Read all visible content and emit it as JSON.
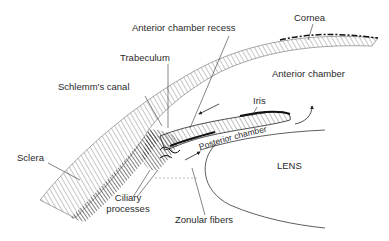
{
  "diagram": {
    "labels": {
      "cornea": "Cornea",
      "anterior_chamber_recess": "Anterior chamber recess",
      "trabeculum": "Trabeculum",
      "schlemms_canal": "Schlemm's canal",
      "anterior_chamber": "Anterior chamber",
      "iris": "Iris",
      "posterior_chamber": "Posterior chamber",
      "lens": "LENS",
      "sclera": "Sclera",
      "ciliary_processes_line1": "Ciliary",
      "ciliary_processes_line2": "processes",
      "zonular_fibers": "Zonular fibers"
    },
    "colors": {
      "ink": "#2a2a2a",
      "background": "#ffffff"
    }
  }
}
